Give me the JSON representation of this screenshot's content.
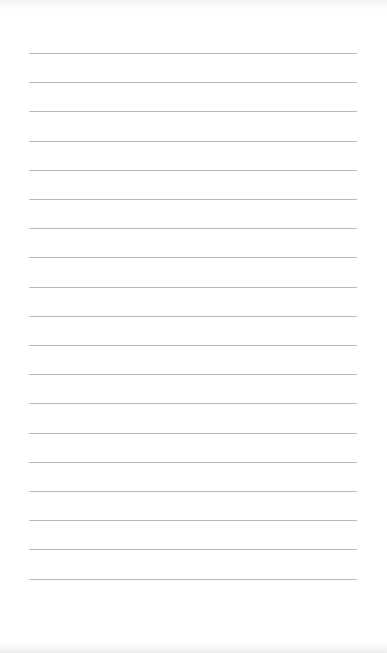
{
  "page": {
    "type": "lined-paper",
    "line_count": 19,
    "line_color": "#b8b8b8",
    "background_color": "#ffffff",
    "first_line_y": 53,
    "line_spacing": 29.2,
    "line_left": 29,
    "line_width": 328
  }
}
